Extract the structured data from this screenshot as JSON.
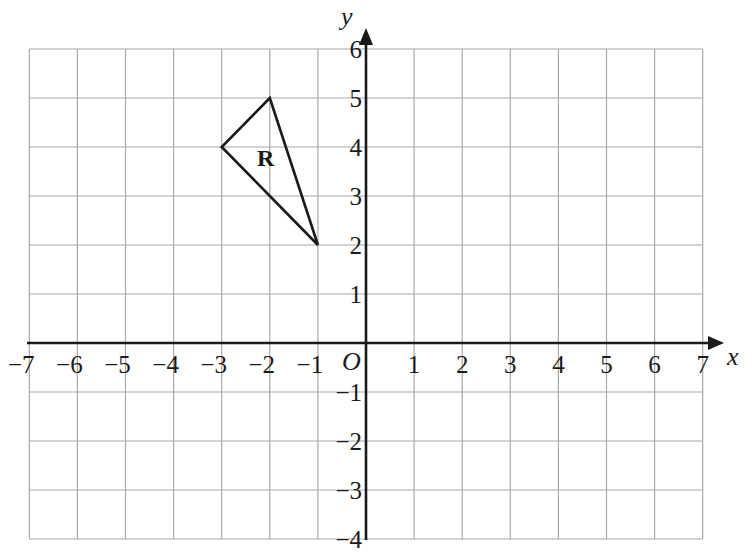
{
  "chart_data": {
    "type": "scatter",
    "title": "",
    "xlabel": "x",
    "ylabel": "y",
    "origin_label": "O",
    "xlim": [
      -7,
      7
    ],
    "ylim": [
      -4,
      6
    ],
    "grid": true,
    "x_ticks": [
      "−7",
      "−6",
      "−5",
      "−4",
      "−3",
      "−2",
      "−1",
      "1",
      "2",
      "3",
      "4",
      "5",
      "6",
      "7"
    ],
    "y_ticks": [
      "6",
      "5",
      "4",
      "3",
      "2",
      "1",
      "−1",
      "−2",
      "−3",
      "−4"
    ],
    "shapes": [
      {
        "name": "R",
        "type": "triangle",
        "vertices": [
          [
            -2,
            5
          ],
          [
            -3,
            4
          ],
          [
            -1,
            2
          ]
        ],
        "label_position": [
          -2,
          3.8
        ]
      }
    ]
  },
  "labels": {
    "x_axis": "x",
    "y_axis": "y",
    "origin": "O",
    "shape": "R"
  },
  "colors": {
    "grid": "#a8a8a8",
    "ink": "#1a1a1a",
    "background": "#ffffff"
  }
}
